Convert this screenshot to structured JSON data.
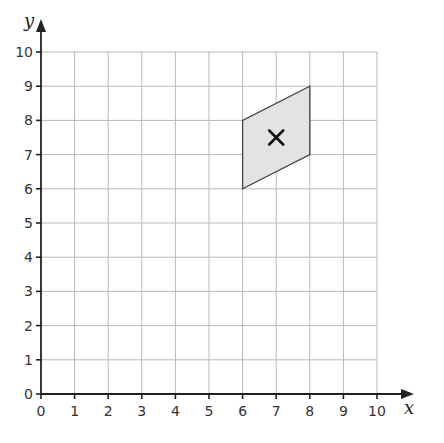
{
  "chart_data": {
    "type": "coordinate-grid",
    "title": "",
    "xlabel": "x",
    "ylabel": "y",
    "xlim": [
      0,
      10
    ],
    "ylim": [
      0,
      10
    ],
    "x_ticks": [
      0,
      1,
      2,
      3,
      4,
      5,
      6,
      7,
      8,
      9,
      10
    ],
    "y_ticks": [
      0,
      1,
      2,
      3,
      4,
      5,
      6,
      7,
      8,
      9,
      10
    ],
    "grid": true,
    "shapes": [
      {
        "name": "parallelogram",
        "vertices": [
          [
            6,
            6
          ],
          [
            6,
            8
          ],
          [
            8,
            9
          ],
          [
            8,
            7
          ]
        ],
        "fill": "#e3e3e3",
        "stroke": "#444444"
      }
    ],
    "markers": [
      {
        "name": "cross",
        "symbol": "x",
        "point": [
          7,
          7.5
        ]
      }
    ]
  },
  "colors": {
    "grid": "#b8b8b8",
    "axis": "#222222",
    "shape_fill": "#e3e3e3"
  }
}
